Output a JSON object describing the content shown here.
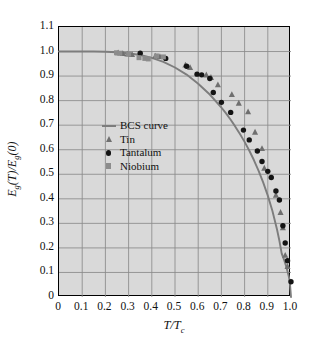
{
  "chart_data": {
    "type": "scatter",
    "title": "",
    "subtitle": "",
    "xlabel": "T/T_c",
    "ylabel": "E_g(T)/E_g(0)",
    "xlim": [
      0,
      1.0
    ],
    "ylim": [
      0,
      1.1
    ],
    "grid": true,
    "grid_color": "#8a8a8a",
    "plot_background": "#d9d9d9",
    "legend_position": "center-left",
    "xticks": [
      "0",
      "0.1",
      "0.2",
      "0.3",
      "0.4",
      "0.5",
      "0.6",
      "0.7",
      "0.8",
      "0.9",
      "1.0"
    ],
    "xtick_values": [
      0,
      0.1,
      0.2,
      0.3,
      0.4,
      0.5,
      0.6,
      0.7,
      0.8,
      0.9,
      1.0
    ],
    "yticks": [
      "0",
      "0.1",
      "0.2",
      "0.3",
      "0.4",
      "0.5",
      "0.6",
      "0.7",
      "0.8",
      "0.9",
      "1.0",
      "1.1"
    ],
    "ytick_values": [
      0,
      0.1,
      0.2,
      0.3,
      0.4,
      0.5,
      0.6,
      0.7,
      0.8,
      0.9,
      1.0,
      1.1
    ],
    "series": [
      {
        "name": "BCS curve",
        "type": "line",
        "marker": "line",
        "color": "#7d7d7d",
        "x": [
          0.0,
          0.05,
          0.1,
          0.15,
          0.2,
          0.25,
          0.3,
          0.35,
          0.4,
          0.45,
          0.5,
          0.55,
          0.6,
          0.65,
          0.7,
          0.72,
          0.74,
          0.76,
          0.78,
          0.8,
          0.82,
          0.84,
          0.86,
          0.88,
          0.9,
          0.92,
          0.94,
          0.95,
          0.96,
          0.97,
          0.98,
          0.99,
          0.995,
          1.0
        ],
        "y": [
          1.0,
          1.0,
          1.0,
          1.0,
          0.999,
          0.997,
          0.993,
          0.986,
          0.974,
          0.958,
          0.935,
          0.906,
          0.869,
          0.825,
          0.772,
          0.748,
          0.722,
          0.694,
          0.664,
          0.632,
          0.597,
          0.558,
          0.515,
          0.467,
          0.413,
          0.35,
          0.274,
          0.229,
          0.177,
          0.152,
          0.122,
          0.086,
          0.061,
          0.0
        ]
      },
      {
        "name": "Tin",
        "type": "scatter",
        "marker": "triangle",
        "color": "#6f6f6f",
        "x": [
          0.255,
          0.275,
          0.295,
          0.315,
          0.415,
          0.435,
          0.545,
          0.565,
          0.635,
          0.655,
          0.685,
          0.745,
          0.775,
          0.815,
          0.845,
          0.875,
          0.885,
          0.935,
          0.955,
          0.965,
          0.975,
          0.985
        ],
        "y": [
          0.995,
          0.992,
          0.99,
          0.988,
          0.982,
          0.98,
          0.945,
          0.935,
          0.905,
          0.895,
          0.865,
          0.825,
          0.79,
          0.755,
          0.672,
          0.605,
          0.525,
          0.415,
          0.345,
          0.282,
          0.17,
          0.125
        ]
      },
      {
        "name": "Tantalum",
        "type": "scatter",
        "marker": "circle",
        "color": "#141414",
        "x": [
          0.35,
          0.46,
          0.55,
          0.595,
          0.615,
          0.65,
          0.665,
          0.7,
          0.74,
          0.795,
          0.82,
          0.855,
          0.875,
          0.9,
          0.915,
          0.935,
          0.95,
          0.965,
          0.975,
          0.985,
          1.0
        ],
        "y": [
          0.993,
          0.972,
          0.94,
          0.908,
          0.905,
          0.89,
          0.833,
          0.793,
          0.752,
          0.68,
          0.64,
          0.595,
          0.552,
          0.512,
          0.487,
          0.432,
          0.395,
          0.29,
          0.22,
          0.148,
          0.062
        ]
      },
      {
        "name": "Niobium",
        "type": "scatter",
        "marker": "square",
        "color": "#8c8c8c",
        "x": [
          0.248,
          0.262,
          0.3,
          0.345,
          0.37,
          0.385,
          0.42,
          0.45
        ],
        "y": [
          0.995,
          0.993,
          0.99,
          0.975,
          0.972,
          0.97,
          0.982,
          0.978
        ]
      }
    ],
    "legend_entries": [
      {
        "label": "BCS curve",
        "marker": "line",
        "color": "#7d7d7d"
      },
      {
        "label": "Tin",
        "marker": "triangle",
        "color": "#6f6f6f"
      },
      {
        "label": "Tantalum",
        "marker": "circle",
        "color": "#141414"
      },
      {
        "label": "Niobium",
        "marker": "square",
        "color": "#8c8c8c"
      }
    ]
  },
  "axis_titles": {
    "x_main": "T/T",
    "x_sub": "c",
    "y_part1": "E",
    "y_sub1": "g",
    "y_part2": "(T)/E",
    "y_sub2": "g",
    "y_part3": "(0)"
  }
}
